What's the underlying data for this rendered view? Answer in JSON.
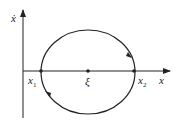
{
  "diagram": {
    "type": "phase-portrait",
    "axes": {
      "x_label": "x",
      "y_label": "ẋ"
    },
    "points": [
      {
        "label": "x",
        "subscript": "1",
        "role": "left-intersection"
      },
      {
        "label": "ξ",
        "subscript": "",
        "role": "center"
      },
      {
        "label": "x",
        "subscript": "2",
        "role": "right-intersection"
      }
    ],
    "orbit": {
      "shape": "closed-ellipse",
      "direction": "clockwise"
    },
    "colors": {
      "stroke": "#222222",
      "background": "#ffffff"
    }
  }
}
